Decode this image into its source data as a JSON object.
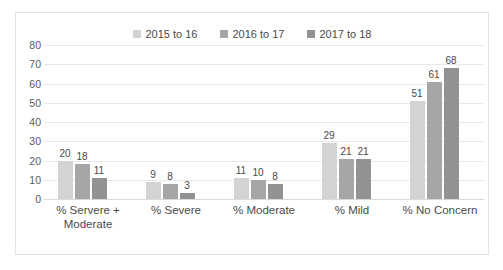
{
  "chart_data": {
    "type": "bar",
    "title": "",
    "subtitle": "",
    "xlabel": "",
    "ylabel": "",
    "ylim": [
      0,
      80
    ],
    "yticks": [
      "0",
      "10",
      "20",
      "30",
      "40",
      "50",
      "60",
      "70",
      "80"
    ],
    "grid": true,
    "legend_position": "top-center",
    "categories": [
      "% Servere + Moderate",
      "% Severe",
      "% Moderate",
      "% Mild",
      "% No Concern"
    ],
    "category_lines": [
      [
        "% Servere +",
        "Moderate"
      ],
      [
        "% Severe"
      ],
      [
        "% Moderate"
      ],
      [
        "% Mild"
      ],
      [
        "% No Concern"
      ]
    ],
    "series": [
      {
        "name": "2015 to 16",
        "color": "#d3d3d3",
        "values": [
          20,
          9,
          11,
          29,
          51
        ]
      },
      {
        "name": "2016 to 17",
        "color": "#a6a6a6",
        "values": [
          18,
          8,
          10,
          21,
          61
        ]
      },
      {
        "name": "2017 to 18",
        "color": "#929292",
        "values": [
          11,
          3,
          8,
          21,
          68
        ]
      }
    ]
  },
  "colors": {
    "series_1": "#d3d3d3",
    "series_2": "#a6a6a6",
    "series_3": "#929292",
    "gridline": "#e8e8e8",
    "frame_border": "#e2e2e2",
    "text": "#4a4a4a",
    "background": "#ffffff"
  }
}
